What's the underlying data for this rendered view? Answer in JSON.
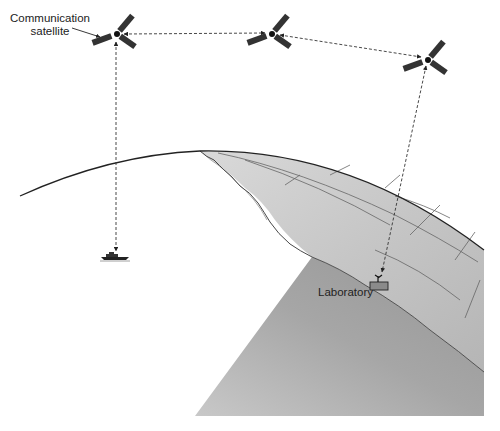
{
  "diagram": {
    "type": "illustration",
    "labels": {
      "satellite_line1": "Communication",
      "satellite_line2": "satellite",
      "laboratory": "Laboratory"
    },
    "nodes": [
      {
        "id": "sat1",
        "kind": "communication-satellite",
        "x": 117,
        "y": 34
      },
      {
        "id": "sat2",
        "kind": "communication-satellite",
        "x": 272,
        "y": 34
      },
      {
        "id": "sat3",
        "kind": "communication-satellite",
        "x": 428,
        "y": 58
      },
      {
        "id": "ship",
        "kind": "ship",
        "x": 115,
        "y": 257
      },
      {
        "id": "lab",
        "kind": "laboratory",
        "x": 379,
        "y": 285
      }
    ],
    "links": [
      {
        "from": "sat1",
        "to": "sat2",
        "style": "dashed",
        "bidirectional": true
      },
      {
        "from": "sat2",
        "to": "sat3",
        "style": "dashed",
        "bidirectional": true
      },
      {
        "from": "sat1",
        "to": "ship",
        "style": "dashed",
        "bidirectional": true
      },
      {
        "from": "sat3",
        "to": "lab",
        "style": "dashed",
        "bidirectional": true
      }
    ],
    "colors": {
      "land_light": "#cfcfcf",
      "land_dark": "#9a9a9a",
      "cross_section": "#a8a8a8",
      "line": "#222222"
    }
  }
}
